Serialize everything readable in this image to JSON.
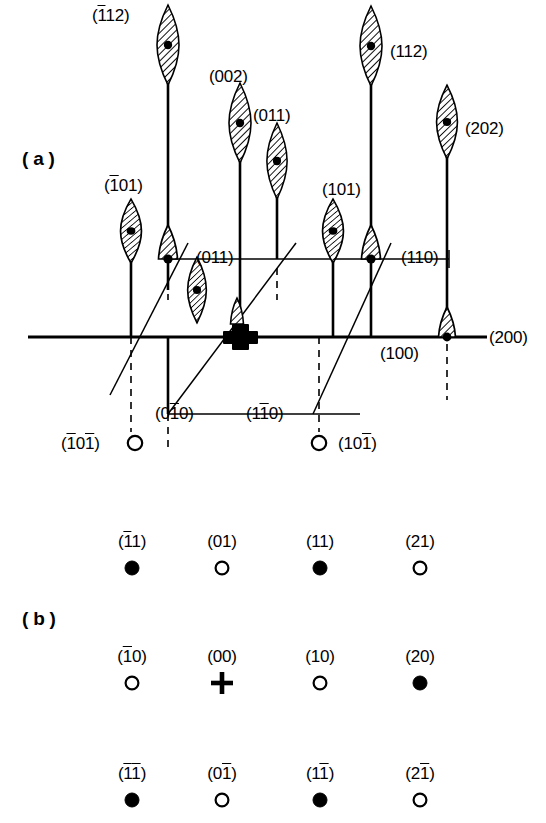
{
  "figure": {
    "kind": "reciprocal-lattice-diffraction-diagram",
    "background_color": "#ffffff",
    "ink_color": "#000000",
    "panels": [
      {
        "id": "a",
        "label": "(a)",
        "x": 22,
        "y": 148
      },
      {
        "id": "b",
        "label": "(b)",
        "x": 22,
        "y": 608
      }
    ]
  },
  "panel_a": {
    "description": "Reciprocal lattice section with hatched lens-shaped streaks (rel-rods) on vertical rods, an in-plane axis line, dashed projection lines and open circles below",
    "origin_marker": {
      "name": "origin-cross",
      "x": 240,
      "y": 337
    },
    "axis_label": "(200)",
    "streak_labels": [
      {
        "id": "n112",
        "text": "(112)",
        "html": "(<span class='ovl'>1</span>12)",
        "x": 92,
        "y": 6,
        "spot_x": 168,
        "spot_y": 45
      },
      {
        "id": "002",
        "text": "(002)",
        "html": "(002)",
        "x": 209,
        "y": 67,
        "spot_x": 240,
        "spot_y": 123
      },
      {
        "id": "011t",
        "text": "(011)",
        "html": "(011)",
        "x": 253,
        "y": 106,
        "spot_x": 277,
        "spot_y": 161
      },
      {
        "id": "112",
        "text": "(112)",
        "html": "(112)",
        "x": 390,
        "y": 42,
        "spot_x": 371,
        "spot_y": 46
      },
      {
        "id": "202",
        "text": "(202)",
        "html": "(202)",
        "x": 465,
        "y": 119,
        "spot_x": 447,
        "spot_y": 122
      },
      {
        "id": "n101",
        "text": "(̐101)",
        "html": "(<span class='ovl'>1</span>01)",
        "x": 104,
        "y": 176,
        "spot_x": 131,
        "spot_y": 231
      },
      {
        "id": "011m",
        "text": "(011)",
        "html": "(011)",
        "x": 196,
        "y": 248,
        "spot_x": 168,
        "spot_y": 259
      },
      {
        "id": "101",
        "text": "(101)",
        "html": "(101)",
        "x": 322,
        "y": 180,
        "spot_x": 333,
        "spot_y": 231
      },
      {
        "id": "110",
        "text": "(110)",
        "html": "(110)",
        "x": 401,
        "y": 248,
        "spot_x": 371,
        "spot_y": 259
      },
      {
        "id": "100",
        "text": "(100)",
        "html": "(100)",
        "x": 380,
        "y": 344,
        "spot_x": 371,
        "spot_y": 337
      },
      {
        "id": "010b",
        "text": "(0̐100)",
        "html": "(0<span class='ovl'>1</span>0)",
        "x": 155,
        "y": 404,
        "spot_x": 168,
        "spot_y": 414
      },
      {
        "id": "1m10",
        "text": "(1̐1̰0)",
        "html": "(1<span class='ovl'>1</span>0)",
        "x": 246,
        "y": 404,
        "spot_x": 0,
        "spot_y": 0
      },
      {
        "id": "200",
        "text": "(200)",
        "html": "(200)",
        "x": 489,
        "y": 328,
        "spot_x": 447,
        "spot_y": 337
      }
    ],
    "open_circle_labels": [
      {
        "id": "n101n",
        "text": "(̐1̰0̰1)",
        "html": "(<span class='ovl'>1</span>0<span class='ovl'>1</span>)",
        "x": 61,
        "y": 434,
        "cx": 135,
        "cy": 443
      },
      {
        "id": "10n1",
        "text": "(10̰1)",
        "html": "(10<span class='ovl'>1</span>)",
        "x": 338,
        "y": 434,
        "cx": 319,
        "cy": 443
      }
    ]
  },
  "panel_b": {
    "description": "Projected 2-D diffraction net: 3 rows x 4 columns of spots; filled = strong, open = weak, cross = direct beam",
    "columns_x": [
      132,
      222,
      320,
      420
    ],
    "rows_y": [
      568,
      683,
      800
    ],
    "label_offset_y": -22,
    "spots": [
      {
        "row": 0,
        "col": 0,
        "label": "(̐1̰1)",
        "html": "(<span class='ovl'>1</span>1)",
        "type": "filled"
      },
      {
        "row": 0,
        "col": 1,
        "label": "(01)",
        "html": "(01)",
        "type": "open"
      },
      {
        "row": 0,
        "col": 2,
        "label": "(11)",
        "html": "(11)",
        "type": "filled"
      },
      {
        "row": 0,
        "col": 3,
        "label": "(21)",
        "html": "(21)",
        "type": "open"
      },
      {
        "row": 1,
        "col": 0,
        "label": "(̐1̰0)",
        "html": "(<span class='ovl'>1</span>0)",
        "type": "open"
      },
      {
        "row": 1,
        "col": 1,
        "label": "(00)",
        "html": "(00)",
        "type": "cross"
      },
      {
        "row": 1,
        "col": 2,
        "label": "(10)",
        "html": "(10)",
        "type": "open"
      },
      {
        "row": 1,
        "col": 3,
        "label": "(20)",
        "html": "(20)",
        "type": "filled"
      },
      {
        "row": 2,
        "col": 0,
        "label": "(̐1̰1)",
        "html": "(<span class='ovl'>1</span><span class='ovl'>1</span>)",
        "type": "filled"
      },
      {
        "row": 2,
        "col": 1,
        "label": "(0̰1)",
        "html": "(0<span class='ovl'>1</span>)",
        "type": "open"
      },
      {
        "row": 2,
        "col": 2,
        "label": "(1̰1)",
        "html": "(1<span class='ovl'>1</span>)",
        "type": "filled"
      },
      {
        "row": 2,
        "col": 3,
        "label": "(2̰1)",
        "html": "(2<span class='ovl'>1</span>)",
        "type": "open"
      }
    ]
  },
  "legend_semantics": {
    "filled_circle": "strong reflection",
    "open_circle": "weak / forbidden reflection",
    "cross": "direct beam origin (000)",
    "hatched_lens": "streaked diffraction spot (rel-rod)"
  }
}
